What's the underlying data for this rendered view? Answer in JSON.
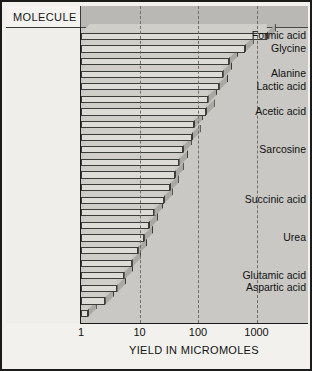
{
  "header": {
    "column_title": "MOLECULE"
  },
  "axis": {
    "x_title": "YIELD IN MICROMOLES",
    "x_ticks": [
      "1",
      "10",
      "100",
      "1000"
    ],
    "x_tick_values": [
      1,
      10,
      100,
      1000
    ]
  },
  "chart_data": {
    "type": "bar",
    "orientation": "horizontal",
    "title": "",
    "xlabel": "YIELD IN MICROMOLES",
    "ylabel": "MOLECULE",
    "xscale": "log",
    "xlim": [
      1,
      2000
    ],
    "xticks": [
      1,
      10,
      100,
      1000
    ],
    "grid": "vertical-dashed",
    "legend": "none",
    "categories": [
      "Formic acid",
      "Glycine",
      "",
      "Alanine",
      "Lactic acid",
      "",
      "Acetic acid",
      "",
      "",
      "Sarcosine",
      "",
      "",
      "",
      "Succinic acid",
      "",
      "",
      "Urea",
      "",
      "",
      "Glutamic acid",
      "Aspartic acid",
      "",
      ""
    ],
    "values": [
      1500,
      630,
      340,
      270,
      230,
      150,
      135,
      85,
      78,
      55,
      48,
      40,
      33,
      26,
      18,
      14.5,
      12,
      9.5,
      7.5,
      5.5,
      4.2,
      2.6,
      1.3
    ],
    "labeled_molecules": [
      {
        "name": "Formic acid",
        "yield": 1500
      },
      {
        "name": "Glycine",
        "yield": 630
      },
      {
        "name": "Alanine",
        "yield": 270
      },
      {
        "name": "Lactic acid",
        "yield": 230
      },
      {
        "name": "Acetic acid",
        "yield": 135
      },
      {
        "name": "Sarcosine",
        "yield": 55
      },
      {
        "name": "Succinic acid",
        "yield": 26
      },
      {
        "name": "Urea",
        "yield": 12
      },
      {
        "name": "Glutamic acid",
        "yield": 5.5
      },
      {
        "name": "Aspartic acid",
        "yield": 4.2
      }
    ]
  },
  "colors": {
    "frame": "#1b1b1b",
    "plot_background": "#c9c8c4",
    "panel_background": "#efeeea",
    "bar_face": "#dedcd7",
    "bar_side": "#a9a8a3",
    "bar_top": "#cfcec9",
    "gridline": "#6f6e6b"
  }
}
